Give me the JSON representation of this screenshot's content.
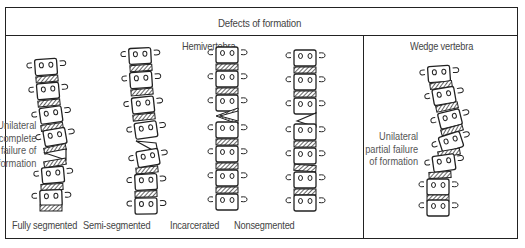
{
  "header": {
    "title": "Defects of formation"
  },
  "sections": {
    "hemivertebra": {
      "title": "Hemivertebra",
      "side_label": [
        "Unilateral",
        "complete",
        "failure of",
        "formation"
      ],
      "types": [
        {
          "label": "Fully segmented"
        },
        {
          "label": "Semi-segmented"
        },
        {
          "label": "Incarcerated"
        },
        {
          "label": "Nonsegmented"
        }
      ]
    },
    "wedge": {
      "title": "Wedge vertebra",
      "side_label": [
        "Unilateral",
        "partial failure",
        "of formation"
      ]
    }
  },
  "colors": {
    "line": "#222222",
    "text": "#444444",
    "background": "#ffffff"
  }
}
